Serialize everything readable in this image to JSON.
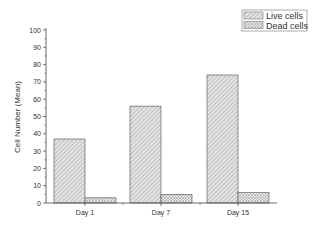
{
  "chart_data": {
    "type": "bar",
    "title": "",
    "xlabel": "",
    "ylabel": "Cell Number (Mean)",
    "ylim": [
      0,
      100
    ],
    "yticks": [
      0,
      10,
      20,
      30,
      40,
      50,
      60,
      70,
      80,
      90,
      100
    ],
    "categories": [
      "Day 1",
      "Day 7",
      "Day 15"
    ],
    "series": [
      {
        "name": "Live cells",
        "values": [
          37,
          56,
          74
        ],
        "pattern": "diagonal-hatch",
        "color": "#c8c8c8"
      },
      {
        "name": "Dead cells",
        "values": [
          3,
          5,
          6
        ],
        "pattern": "crosshatch",
        "color": "#d8d8d8"
      }
    ],
    "grid": false,
    "legend_position": "top-right"
  }
}
